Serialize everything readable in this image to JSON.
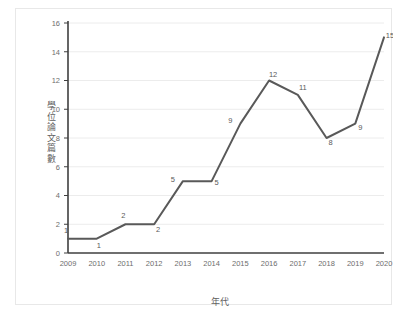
{
  "chart_data": {
    "type": "line",
    "title": "",
    "xlabel": "年代",
    "ylabel": "學位論文篇數",
    "categories": [
      "2009",
      "2010",
      "2011",
      "2012",
      "2013",
      "2014",
      "2015",
      "2016",
      "2017",
      "2018",
      "2019",
      "2020"
    ],
    "values": [
      1,
      1,
      2,
      2,
      5,
      5,
      9,
      12,
      11,
      8,
      9,
      15
    ],
    "point_labels": [
      "1",
      "1",
      "2",
      "2",
      "5",
      "5",
      "9",
      "12",
      "11",
      "8",
      "9",
      "15"
    ],
    "ylim": [
      0,
      16
    ],
    "ytick_step": 2,
    "yticks": [
      "0",
      "2",
      "4",
      "6",
      "8",
      "10",
      "12",
      "14",
      "16"
    ],
    "grid": true,
    "legend": "none",
    "series": [
      {
        "name": "學位論文篇數",
        "values": [
          1,
          1,
          2,
          2,
          5,
          5,
          9,
          12,
          11,
          8,
          9,
          15
        ]
      }
    ],
    "colors": {
      "line": "#595959",
      "axis": "#3f3f3f",
      "grid": "#ececec",
      "text": "#6d6d6d",
      "background": "#ffffff",
      "frame_border": "#e8e8e8"
    },
    "label_offsets": [
      {
        "dx": -2,
        "dy": -6
      },
      {
        "dx": 2,
        "dy": 9
      },
      {
        "dx": -2,
        "dy": -6
      },
      {
        "dx": 4,
        "dy": 8
      },
      {
        "dx": -10,
        "dy": 1
      },
      {
        "dx": 5,
        "dy": 4
      },
      {
        "dx": -10,
        "dy": -1
      },
      {
        "dx": 4,
        "dy": -4
      },
      {
        "dx": 5,
        "dy": -5
      },
      {
        "dx": 4,
        "dy": 7
      },
      {
        "dx": 5,
        "dy": 6
      },
      {
        "dx": 6,
        "dy": 1
      }
    ]
  }
}
